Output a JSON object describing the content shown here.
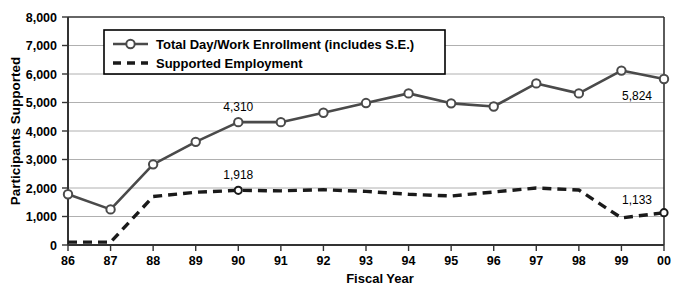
{
  "chart_data": {
    "type": "line",
    "title": "",
    "xlabel": "Fiscal Year",
    "ylabel": "Participants Supported",
    "ylim": [
      0,
      8000
    ],
    "ytick_step": 1000,
    "grid": true,
    "legend_position": "top-left-inside",
    "categories": [
      "86",
      "87",
      "88",
      "89",
      "90",
      "91",
      "92",
      "93",
      "94",
      "95",
      "96",
      "97",
      "98",
      "99",
      "00"
    ],
    "ytick_labels": [
      "0",
      "1,000",
      "2,000",
      "3,000",
      "4,000",
      "5,000",
      "6,000",
      "7,000",
      "8,000"
    ],
    "series": [
      {
        "name": "Total Day/Work Enrollment (includes S.E.)",
        "style": "solid-with-circle-markers",
        "color": "#4a4a4a",
        "marker_fill": "#ffffff",
        "values": [
          1780,
          1250,
          2830,
          3620,
          4310,
          4310,
          4640,
          4980,
          5320,
          4970,
          4860,
          5670,
          5320,
          6120,
          5824
        ]
      },
      {
        "name": "Supported Employment",
        "style": "dashed",
        "color": "#1a1a1a",
        "values": [
          100,
          100,
          1700,
          1850,
          1918,
          1900,
          1940,
          1880,
          1780,
          1720,
          1860,
          2000,
          1930,
          950,
          1133
        ]
      }
    ],
    "annotations": [
      {
        "text": "4,310",
        "series": "Total Day/Work Enrollment (includes S.E.)",
        "category": "90",
        "value": 4310
      },
      {
        "text": "1,918",
        "series": "Supported Employment",
        "category": "90",
        "value": 1918
      },
      {
        "text": "5,824",
        "series": "Total Day/Work Enrollment (includes S.E.)",
        "category": "00",
        "value": 5824
      },
      {
        "text": "1,133",
        "series": "Supported Employment",
        "category": "00",
        "value": 1133
      }
    ]
  },
  "legend": {
    "entries": [
      {
        "label": "Total Day/Work Enrollment (includes S.E.)"
      },
      {
        "label": "Supported Employment"
      }
    ]
  }
}
